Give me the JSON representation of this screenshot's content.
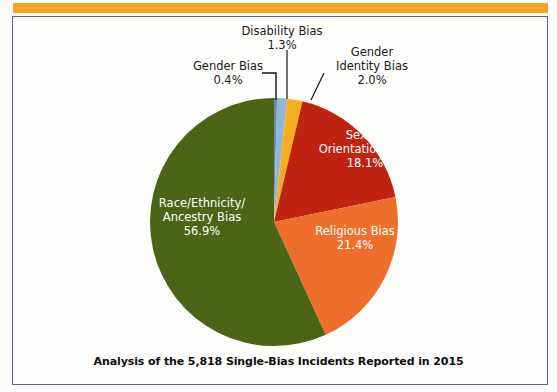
{
  "accent_color": "#f6a32a",
  "panel_border_color": "#5a6484",
  "caption": "Analysis of the 5,818 Single-Bias Incidents Reported in 2015",
  "chart_data": {
    "type": "pie",
    "title": "Analysis of the 5,818 Single-Bias Incidents Reported in 2015",
    "total_incidents": "5,818",
    "year": "2015",
    "legend_position": "none-labels-on-slices",
    "start_angle_deg": 0,
    "direction": "clockwise",
    "categories": [
      "Gender Bias",
      "Disability Bias",
      "Gender Identity Bias",
      "Sexual Orientation Bias",
      "Religious Bias",
      "Race/Ethnicity/Ancestry Bias"
    ],
    "values": [
      0.4,
      1.3,
      2.0,
      18.1,
      21.4,
      56.9
    ],
    "value_labels": [
      "0.4%",
      "1.3%",
      "2.0%",
      "18.1%",
      "21.4%",
      "56.9%"
    ],
    "colors": [
      "#6f88b0",
      "#8fb8d8",
      "#f5ae1f",
      "#bf2413",
      "#ee6f2c",
      "#4b6416"
    ],
    "label_placement": [
      "outside",
      "outside",
      "outside",
      "inside",
      "inside",
      "inside"
    ],
    "slices": [
      {
        "name": "Gender Bias",
        "value": 0.4,
        "label": "Gender Bias",
        "percent": "0.4%",
        "color": "#6f88b0",
        "placement": "outside"
      },
      {
        "name": "Disability Bias",
        "value": 1.3,
        "label": "Disability Bias",
        "percent": "1.3%",
        "color": "#8fb8d8",
        "placement": "outside"
      },
      {
        "name": "Gender Identity Bias",
        "value": 2.0,
        "label": "Gender Identity Bias",
        "percent": "2.0%",
        "color": "#f5ae1f",
        "placement": "outside"
      },
      {
        "name": "Sexual Orientation Bias",
        "value": 18.1,
        "label": "Sexual Orientation Bias",
        "percent": "18.1%",
        "color": "#bf2413",
        "placement": "inside"
      },
      {
        "name": "Religious Bias",
        "value": 21.4,
        "label": "Religious Bias",
        "percent": "21.4%",
        "color": "#ee6f2c",
        "placement": "inside"
      },
      {
        "name": "Race/Ethnicity/Ancestry Bias",
        "value": 56.9,
        "label": "Race/Ethnicity/Ancestry Bias",
        "percent": "56.9%",
        "color": "#4b6416",
        "placement": "inside"
      }
    ]
  },
  "labels": {
    "disability": {
      "line1": "Disability Bias",
      "line2": "1.3%"
    },
    "gender": {
      "line1": "Gender Bias",
      "line2": "0.4%"
    },
    "gender_id": {
      "line1": "Gender",
      "line2": "Identity Bias",
      "line3": "2.0%"
    },
    "sexual": {
      "line1": "Sexual",
      "line2": "Orientation Bias",
      "line3": "18.1%"
    },
    "religious": {
      "line1": "Religious Bias",
      "line2": "21.4%"
    },
    "race": {
      "line1": "Race/Ethnicity/",
      "line2": "Ancestry Bias",
      "line3": "56.9%"
    }
  }
}
